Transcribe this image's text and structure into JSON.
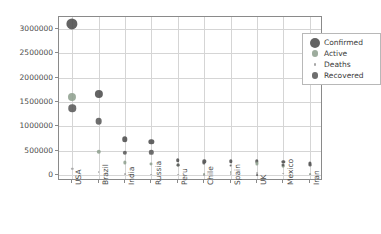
{
  "chart_data": {
    "type": "scatter",
    "title": "",
    "xlabel": "",
    "ylabel": "",
    "ylim": [
      -120000,
      3250000
    ],
    "yticks": [
      0,
      500000,
      1000000,
      1500000,
      2000000,
      2500000,
      3000000
    ],
    "ytick_labels": [
      "0",
      "500000",
      "1000000",
      "1500000",
      "2000000",
      "2500000",
      "3000000"
    ],
    "grid": true,
    "legend_position": "upper right",
    "marker_size_encodes": "value",
    "categories": [
      "USA",
      "Brazil",
      "India",
      "Russia",
      "Peru",
      "Chile",
      "Spain",
      "UK",
      "Mexico",
      "Iran"
    ],
    "series": [
      {
        "name": "Confirmed",
        "color": "#4d4d4d",
        "values": [
          3100000,
          1670000,
          740000,
          690000,
          312000,
          284000,
          285000,
          288000,
          268000,
          240000
        ]
      },
      {
        "name": "Active",
        "color": "#8fa08f",
        "values": [
          1610000,
          480000,
          262000,
          220000,
          205000,
          22000,
          60000,
          240000,
          180000,
          25000
        ]
      },
      {
        "name": "Deaths",
        "color": "#9a9a9a",
        "values": [
          135000,
          66000,
          20000,
          10000,
          11000,
          5800,
          28400,
          44600,
          32000,
          11700
        ]
      },
      {
        "name": "Recovered",
        "color": "#5a5a5a",
        "values": [
          1370000,
          1110000,
          457000,
          470000,
          200000,
          256000,
          196000,
          1400,
          215000,
          203000
        ]
      }
    ]
  },
  "legend": {
    "entries": [
      {
        "label": "Confirmed",
        "marker_radius": 5.0,
        "color": "#4d4d4d"
      },
      {
        "label": "Active",
        "marker_radius": 3.4,
        "color": "#8fa08f"
      },
      {
        "label": "Deaths",
        "marker_radius": 1.1,
        "color": "#9a9a9a"
      },
      {
        "label": "Recovered",
        "marker_radius": 3.4,
        "color": "#5a5a5a"
      }
    ]
  },
  "axes": {
    "frame_color": "#8a8a8a",
    "grid_color": "#d5d5d5",
    "tick_label_color": "#4a4a4a"
  }
}
